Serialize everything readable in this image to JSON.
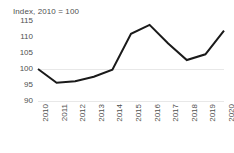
{
  "chart_data": {
    "type": "line",
    "title": "Index, 2010 = 100",
    "xlabel": "",
    "ylabel": "",
    "categories": [
      "2010",
      "2011",
      "2012",
      "2013",
      "2014",
      "2015",
      "2016",
      "2017",
      "2018",
      "2019",
      "2020"
    ],
    "values": [
      100,
      95.7,
      96.2,
      97.6,
      99.8,
      111.0,
      113.8,
      108.0,
      102.8,
      104.6,
      112.0
    ],
    "series": [
      {
        "name": "Index",
        "values": [
          100,
          95.7,
          96.2,
          97.6,
          99.8,
          111.0,
          113.8,
          108.0,
          102.8,
          104.6,
          112.0
        ]
      }
    ],
    "ylim": [
      90,
      115
    ],
    "yticks": [
      90,
      95,
      100,
      105,
      110,
      115
    ],
    "ytick_labels": [
      "90",
      "95",
      "100",
      "105",
      "110",
      "115"
    ],
    "xlim_categories": [
      "2010",
      "2020"
    ],
    "grid": true,
    "gridlines_at": [
      90,
      100
    ],
    "legend": false,
    "legend_position": "none",
    "line_color": "#1a1a1a",
    "grid_color": "#e8e8e8",
    "text_color": "#4f4f4f",
    "background_color": "#ffffff",
    "line_width": 2,
    "markers": false,
    "xtick_rotation": -90
  },
  "axes": {
    "y_labels": [
      "115",
      "110",
      "105",
      "100",
      "95",
      "90"
    ],
    "x_labels": [
      "2010",
      "2011",
      "2012",
      "2013",
      "2014",
      "2015",
      "2016",
      "2017",
      "2018",
      "2019",
      "2020"
    ]
  }
}
